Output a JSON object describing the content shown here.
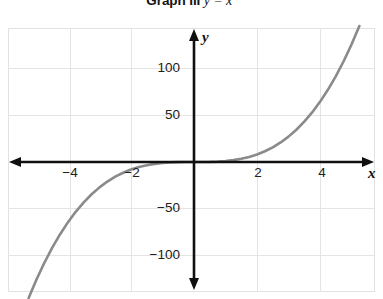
{
  "title": {
    "prefix": "Graph III",
    "equation": "y = x",
    "exponent": "3",
    "full": "Graph III  y = x3"
  },
  "axis_labels": {
    "x": "x",
    "y": "y"
  },
  "colors": {
    "curve": "#8a8a8a",
    "axis": "#101010",
    "grid": "#e4e4e4",
    "frame": "#e2e2e2",
    "text": "#202020",
    "background": "#ffffff"
  },
  "chart_data": {
    "type": "line",
    "title": "Graph III  y = x3",
    "function": "y = x^3",
    "xlabel": "x",
    "ylabel": "y",
    "xlim": [
      -5.7,
      5.8
    ],
    "ylim": [
      -147,
      148
    ],
    "grid": true,
    "legend": false,
    "xticks": [
      -4,
      -2,
      2,
      4
    ],
    "xtick_labels": [
      "−4",
      "−2",
      "2",
      "4"
    ],
    "yticks": [
      100,
      50,
      -50,
      -100
    ],
    "ytick_labels": [
      "100",
      "50",
      "−50",
      "−100"
    ],
    "series": [
      {
        "name": "y = x^3",
        "color": "#8a8a8a",
        "x": [
          -5.25,
          -5.0,
          -4.75,
          -4.5,
          -4.25,
          -4.0,
          -3.75,
          -3.5,
          -3.25,
          -3.0,
          -2.75,
          -2.5,
          -2.25,
          -2.0,
          -1.75,
          -1.5,
          -1.25,
          -1.0,
          -0.75,
          -0.5,
          -0.25,
          0,
          0.25,
          0.5,
          0.75,
          1.0,
          1.25,
          1.5,
          1.75,
          2.0,
          2.25,
          2.5,
          2.75,
          3.0,
          3.25,
          3.5,
          3.75,
          4.0,
          4.25,
          4.5,
          4.75,
          5.0,
          5.25
        ],
        "y": [
          -144.7,
          -125.0,
          -107.2,
          -91.1,
          -76.8,
          -64.0,
          -52.7,
          -42.9,
          -34.3,
          -27.0,
          -20.8,
          -15.6,
          -11.4,
          -8.0,
          -5.4,
          -3.4,
          -2.0,
          -1.0,
          -0.4,
          -0.1,
          0.0,
          0,
          0.0,
          0.1,
          0.4,
          1.0,
          2.0,
          3.4,
          5.4,
          8.0,
          11.4,
          15.6,
          20.8,
          27.0,
          34.3,
          42.9,
          52.7,
          64.0,
          76.8,
          91.1,
          107.2,
          125.0,
          144.7
        ]
      }
    ]
  }
}
